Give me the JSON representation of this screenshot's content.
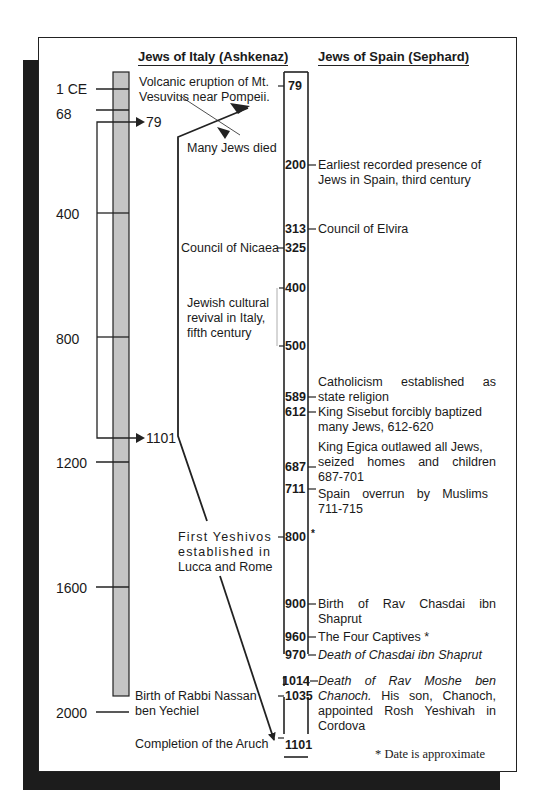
{
  "headers": {
    "italy": "Jews of Italy (Ashkenaz)",
    "spain": "Jews of Spain (Sephard)"
  },
  "left_scale": {
    "labels": [
      "1 CE",
      "68",
      "400",
      "800",
      "1200",
      "1600",
      "2000"
    ],
    "zoom_marks": [
      "79",
      "1101"
    ]
  },
  "italy_events": {
    "vesuvius": [
      "Volcanic eruption of Mt.",
      "Vesuvius near Pompeii."
    ],
    "many_died": "Many Jews died",
    "nicaea": "Council of Nicaea",
    "revival": [
      "Jewish cultural",
      "revival in Italy,",
      "fifth century"
    ],
    "yeshivos": [
      "First Yeshivos",
      "established in",
      "Lucca and Rome"
    ],
    "nassan": [
      "Birth of Rabbi Nassan",
      "ben Yechiel"
    ],
    "aruch": "Completion of the Aruch"
  },
  "center_years": {
    "y79": "79",
    "y200": "200",
    "y313": "313",
    "y325": "325",
    "y400": "400",
    "y500": "500",
    "y589": "589",
    "y612": "612",
    "y687": "687",
    "y711": "711",
    "y800": "800",
    "y800_mark": "*",
    "y900": "900",
    "y960": "960",
    "y970": "970",
    "y1014": "1014",
    "y1035": "1035",
    "y1101": "1101"
  },
  "spain_events": {
    "e200": [
      "Earliest recorded presence of",
      "Jews in Spain, third century"
    ],
    "e313": "Council of Elvira",
    "e589": [
      "Catholicism established as",
      "state religion"
    ],
    "e612": [
      "King Sisebut forcibly baptized",
      "many Jews, 612-620"
    ],
    "e687": [
      "King Egica outlawed all Jews,",
      "seized homes and children",
      "687-701"
    ],
    "e711": [
      "Spain overrun by Muslims",
      "711-715"
    ],
    "e900": [
      "Birth of Rav Chasdai ibn",
      "Shaprut"
    ],
    "e960": "The Four Captives *",
    "e970": "Death of Chasdai ibn Shaprut",
    "e1014_italic": "Death of Rav Moshe ben Chanoch.",
    "e1014_rest": "His son, Chanoch, appointed Rosh Yeshivah in Cordova"
  },
  "footnote": "* Date is approximate",
  "colors": {
    "bar_fill": "#c4c4c4",
    "line": "#222222",
    "shadow": "#1c1c1c"
  }
}
